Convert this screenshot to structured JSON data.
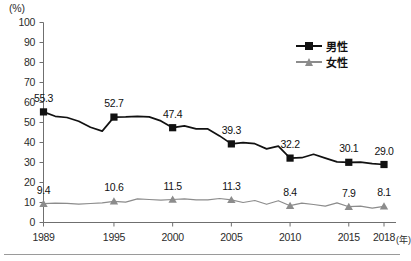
{
  "chart_data": {
    "type": "line",
    "title": "",
    "xlabel": "(年)",
    "ylabel": "(%)",
    "ylim": [
      0,
      100
    ],
    "ytick_step": 10,
    "grid": false,
    "legend_position": "top-right",
    "yticks": [
      "100",
      "90",
      "80",
      "70",
      "60",
      "50",
      "40",
      "30",
      "20",
      "10",
      "0"
    ],
    "categories": [
      "1989",
      "1995",
      "2000",
      "2005",
      "2010",
      "2015",
      "2018"
    ],
    "category_x": [
      1989,
      1995,
      2000,
      2005,
      2010,
      2015,
      2018
    ],
    "series": [
      {
        "name": "男性",
        "color": "#111111",
        "marker": "square",
        "values": [
          55.3,
          52.7,
          47.4,
          39.3,
          32.2,
          30.1,
          29.0
        ],
        "labels": [
          "55.3",
          "52.7",
          "47.4",
          "39.3",
          "32.2",
          "30.1",
          "29.0"
        ],
        "yearly_x": [
          1989,
          1990,
          1991,
          1992,
          1993,
          1994,
          1995,
          1996,
          1997,
          1998,
          1999,
          2000,
          2001,
          2002,
          2003,
          2004,
          2005,
          2006,
          2007,
          2008,
          2009,
          2010,
          2011,
          2012,
          2013,
          2014,
          2015,
          2016,
          2017,
          2018
        ],
        "yearly_values": [
          55.3,
          53.1,
          52.5,
          50.6,
          47.6,
          45.7,
          52.7,
          52.8,
          53.1,
          52.8,
          50.8,
          47.4,
          48.3,
          46.8,
          46.8,
          43.3,
          39.3,
          39.9,
          39.4,
          36.8,
          38.2,
          32.2,
          32.4,
          34.1,
          32.2,
          30.3,
          30.1,
          30.2,
          29.4,
          29.0
        ]
      },
      {
        "name": "女性",
        "color": "#8c8c8c",
        "marker": "triangle",
        "values": [
          9.4,
          10.6,
          11.5,
          11.3,
          8.4,
          7.9,
          8.1
        ],
        "labels": [
          "9.4",
          "10.6",
          "11.5",
          "11.3",
          "8.4",
          "7.9",
          "8.1"
        ],
        "yearly_x": [
          1989,
          1990,
          1991,
          1992,
          1993,
          1994,
          1995,
          1996,
          1997,
          1998,
          1999,
          2000,
          2001,
          2002,
          2003,
          2004,
          2005,
          2006,
          2007,
          2008,
          2009,
          2010,
          2011,
          2012,
          2013,
          2014,
          2015,
          2016,
          2017,
          2018
        ],
        "yearly_values": [
          9.4,
          9.7,
          9.6,
          9.2,
          9.5,
          9.8,
          10.6,
          10.2,
          11.8,
          11.5,
          11.2,
          11.5,
          11.8,
          11.3,
          11.3,
          12.0,
          11.3,
          10.0,
          11.0,
          9.1,
          10.9,
          8.4,
          9.7,
          9.0,
          8.2,
          9.8,
          7.9,
          8.2,
          7.2,
          8.1
        ]
      }
    ]
  },
  "axis": {
    "unit_y": "(%)",
    "unit_x": "(年)"
  },
  "legend": {
    "items": [
      {
        "label": "男性"
      },
      {
        "label": "女性"
      }
    ]
  },
  "colors": {
    "male": "#111111",
    "female": "#8c8c8c",
    "axis": "#6f6f6f",
    "text": "#1a1a1a"
  }
}
